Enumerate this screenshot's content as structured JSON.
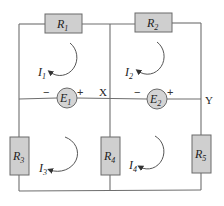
{
  "diagram": {
    "type": "circuit",
    "resistors": [
      {
        "id": "R1",
        "symbol": "R",
        "sub": "1"
      },
      {
        "id": "R2",
        "symbol": "R",
        "sub": "2"
      },
      {
        "id": "R3",
        "symbol": "R",
        "sub": "3"
      },
      {
        "id": "R4",
        "symbol": "R",
        "sub": "4"
      },
      {
        "id": "R5",
        "symbol": "R",
        "sub": "5"
      }
    ],
    "sources": [
      {
        "id": "E1",
        "symbol": "E",
        "sub": "1",
        "minus": "−",
        "plus": "+"
      },
      {
        "id": "E2",
        "symbol": "E",
        "sub": "2",
        "minus": "−",
        "plus": "+"
      }
    ],
    "loop_currents": [
      {
        "id": "I1",
        "symbol": "I",
        "sub": "1",
        "direction": "clockwise"
      },
      {
        "id": "I2",
        "symbol": "I",
        "sub": "2",
        "direction": "clockwise"
      },
      {
        "id": "I3",
        "symbol": "I",
        "sub": "3",
        "direction": "clockwise"
      },
      {
        "id": "I4",
        "symbol": "I",
        "sub": "4",
        "direction": "clockwise"
      }
    ],
    "nodes": [
      {
        "id": "X",
        "label": "X"
      },
      {
        "id": "Y",
        "label": "Y"
      }
    ],
    "colors": {
      "wire": "#6e6e6e",
      "component_fill": "#cfcfcf"
    }
  }
}
